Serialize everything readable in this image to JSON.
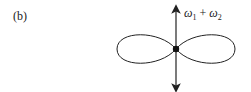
{
  "panel": {
    "label": "(b)"
  },
  "diagram": {
    "arrow_label": {
      "omega": "ω",
      "sub1": "1",
      "plus": "+",
      "sub2": "2"
    },
    "colors": {
      "stroke": "#222222",
      "background": "#ffffff"
    }
  }
}
